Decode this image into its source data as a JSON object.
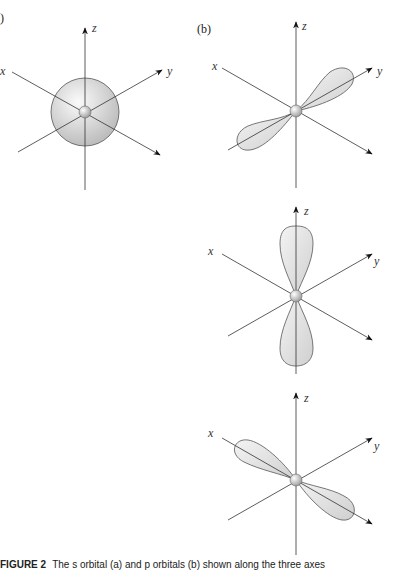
{
  "figure": {
    "panel_labels": {
      "a": ")",
      "b": "(b)"
    },
    "panels": [
      {
        "id": "a-s-orbital",
        "description": "spherical s orbital",
        "axes": {
          "x": "x",
          "y": "y",
          "z": "z"
        }
      },
      {
        "id": "b-py-orbital",
        "description": "p orbital along y axis",
        "axes": {
          "x": "x",
          "y": "y",
          "z": "z"
        }
      },
      {
        "id": "b-pz-orbital",
        "description": "p orbital along z axis",
        "axes": {
          "x": "x",
          "y": "y",
          "z": "z"
        }
      },
      {
        "id": "b-px-orbital",
        "description": "p orbital along x axis",
        "axes": {
          "x": "x",
          "y": "y",
          "z": "z"
        }
      }
    ],
    "caption": {
      "label": "FIGURE 2",
      "text": "The s orbital (a) and p orbitals (b) shown along the three axes"
    },
    "colors": {
      "line": "#333333",
      "fill": "#e4e4e4",
      "nucleus": "#cfcfcf"
    }
  }
}
